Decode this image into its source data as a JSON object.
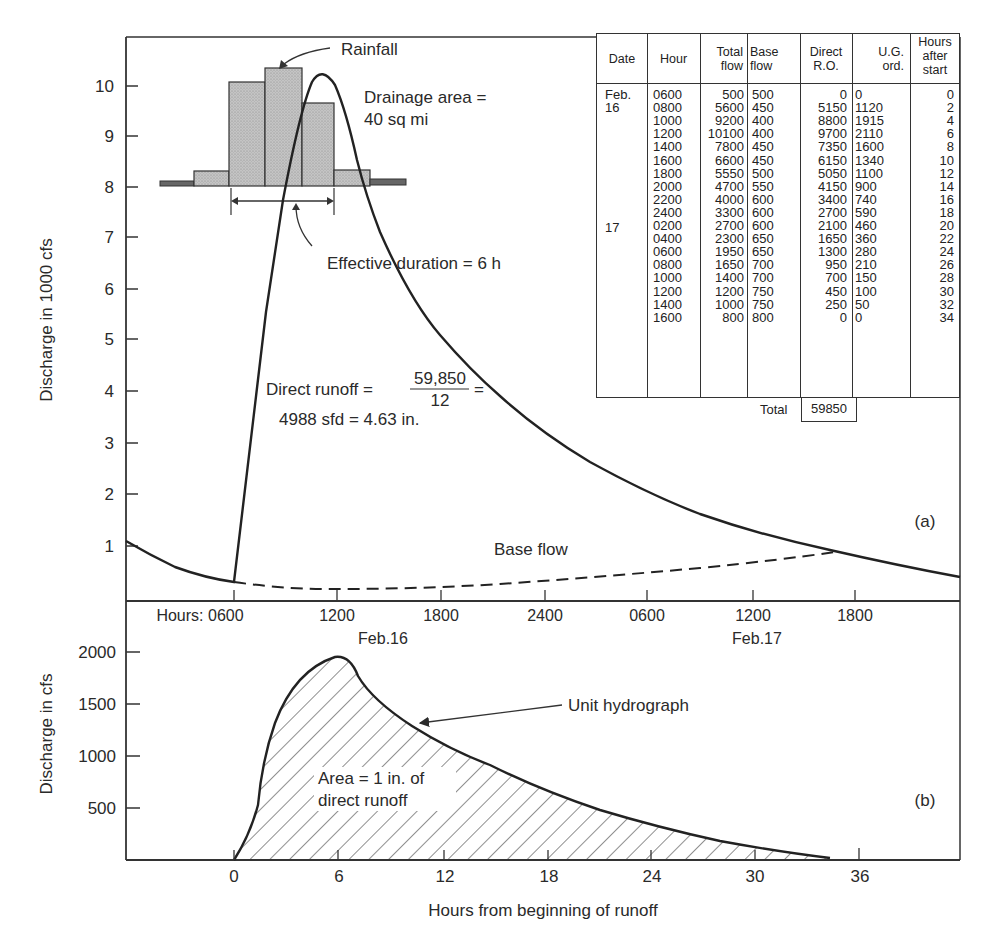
{
  "chart_data": [
    {
      "id": "a",
      "type": "line",
      "panel_label": "(a)",
      "title": "Streamflow hydrograph with base flow separation",
      "ylabel": "Discharge in 1000 cfs",
      "xlabel": "Hours",
      "ylim": [
        0,
        11
      ],
      "yticks": [
        1,
        2,
        3,
        4,
        5,
        6,
        7,
        8,
        9,
        10
      ],
      "x_prefix": "Hours:",
      "xtick_labels": [
        "0600",
        "1200",
        "1800",
        "2400",
        "0600",
        "1200",
        "1800"
      ],
      "date_labels": [
        {
          "text": "Feb.16",
          "under_tick": "1200"
        },
        {
          "text": "Feb.17",
          "under_tick": "1200"
        }
      ],
      "grid": false,
      "series": [
        {
          "name": "Total flow",
          "style": "solid",
          "unit": "cfs",
          "x_hours_from_0600_feb16": [
            0,
            2,
            4,
            6,
            8,
            10,
            12,
            14,
            16,
            18,
            20,
            22,
            24,
            26,
            28,
            30,
            32,
            34
          ],
          "values": [
            500,
            5600,
            9200,
            10100,
            7800,
            6600,
            5550,
            4700,
            4000,
            3300,
            2700,
            2300,
            1950,
            1650,
            1400,
            1200,
            1000,
            800
          ]
        },
        {
          "name": "Base flow",
          "style": "dashed",
          "unit": "cfs",
          "x_hours_from_0600_feb16": [
            0,
            2,
            4,
            6,
            8,
            10,
            12,
            14,
            16,
            18,
            20,
            22,
            24,
            26,
            28,
            30,
            32,
            34
          ],
          "values": [
            500,
            450,
            400,
            400,
            450,
            450,
            500,
            550,
            600,
            600,
            600,
            650,
            650,
            700,
            700,
            750,
            750,
            800
          ]
        }
      ],
      "rainfall_inset": {
        "label": "Rainfall",
        "bars_relative_heights": [
          0.05,
          0.35,
          1.0,
          1.08,
          0.85,
          0.28,
          0.05
        ],
        "effective_duration_label": "Effective duration = 6 h"
      },
      "annotations": [
        "Rainfall",
        "Drainage area =",
        "40 sq mi",
        "Effective duration = 6 h",
        "Direct runoff =",
        "59,850",
        "12",
        "4988 sfd = 4.63 in.",
        "Base flow",
        "(a)"
      ]
    },
    {
      "id": "b",
      "type": "area",
      "panel_label": "(b)",
      "title": "Unit hydrograph",
      "ylabel": "Discharge in cfs",
      "xlabel": "Hours from beginning of runoff",
      "ylim": [
        0,
        2200
      ],
      "yticks": [
        500,
        1000,
        1500,
        2000
      ],
      "xticks": [
        0,
        6,
        12,
        18,
        24,
        30,
        36
      ],
      "xlim": [
        -10,
        42
      ],
      "grid": false,
      "series": [
        {
          "name": "Unit hydrograph",
          "style": "solid-hatched",
          "x": [
            0,
            2,
            4,
            6,
            8,
            10,
            12,
            14,
            16,
            18,
            20,
            22,
            24,
            26,
            28,
            30,
            32,
            34
          ],
          "values": [
            0,
            1120,
            1915,
            2110,
            1600,
            1340,
            1100,
            900,
            740,
            590,
            460,
            360,
            280,
            210,
            150,
            100,
            50,
            0
          ]
        }
      ],
      "annotations": [
        "Unit hydrograph",
        "Area = 1 in. of",
        "direct runoff",
        "(b)"
      ]
    }
  ],
  "table": {
    "headers": [
      [
        "Date"
      ],
      [
        "Hour"
      ],
      [
        "Total",
        "flow"
      ],
      [
        "Base",
        "flow"
      ],
      [
        "Direct",
        "R.O."
      ],
      [
        "U.G.",
        "ord."
      ],
      [
        "Hours",
        "after",
        "start"
      ]
    ],
    "rows": [
      {
        "date": "Feb.",
        "hour": "0600",
        "total": "500",
        "base": "500",
        "direct": "0",
        "ug": "0",
        "hours": "0"
      },
      {
        "date": "16",
        "hour": "0800",
        "total": "5600",
        "base": "450",
        "direct": "5150",
        "ug": "1120",
        "hours": "2"
      },
      {
        "date": "",
        "hour": "1000",
        "total": "9200",
        "base": "400",
        "direct": "8800",
        "ug": "1915",
        "hours": "4"
      },
      {
        "date": "",
        "hour": "1200",
        "total": "10100",
        "base": "400",
        "direct": "9700",
        "ug": "2110",
        "hours": "6"
      },
      {
        "date": "",
        "hour": "1400",
        "total": "7800",
        "base": "450",
        "direct": "7350",
        "ug": "1600",
        "hours": "8"
      },
      {
        "date": "",
        "hour": "1600",
        "total": "6600",
        "base": "450",
        "direct": "6150",
        "ug": "1340",
        "hours": "10"
      },
      {
        "date": "",
        "hour": "1800",
        "total": "5550",
        "base": "500",
        "direct": "5050",
        "ug": "1100",
        "hours": "12"
      },
      {
        "date": "",
        "hour": "2000",
        "total": "4700",
        "base": "550",
        "direct": "4150",
        "ug": "900",
        "hours": "14"
      },
      {
        "date": "",
        "hour": "2200",
        "total": "4000",
        "base": "600",
        "direct": "3400",
        "ug": "740",
        "hours": "16"
      },
      {
        "date": "",
        "hour": "2400",
        "total": "3300",
        "base": "600",
        "direct": "2700",
        "ug": "590",
        "hours": "18"
      },
      {
        "date": "17",
        "hour": "0200",
        "total": "2700",
        "base": "600",
        "direct": "2100",
        "ug": "460",
        "hours": "20"
      },
      {
        "date": "",
        "hour": "0400",
        "total": "2300",
        "base": "650",
        "direct": "1650",
        "ug": "360",
        "hours": "22"
      },
      {
        "date": "",
        "hour": "0600",
        "total": "1950",
        "base": "650",
        "direct": "1300",
        "ug": "280",
        "hours": "24"
      },
      {
        "date": "",
        "hour": "0800",
        "total": "1650",
        "base": "700",
        "direct": "950",
        "ug": "210",
        "hours": "26"
      },
      {
        "date": "",
        "hour": "1000",
        "total": "1400",
        "base": "700",
        "direct": "700",
        "ug": "150",
        "hours": "28"
      },
      {
        "date": "",
        "hour": "1200",
        "total": "1200",
        "base": "750",
        "direct": "450",
        "ug": "100",
        "hours": "30"
      },
      {
        "date": "",
        "hour": "1400",
        "total": "1000",
        "base": "750",
        "direct": "250",
        "ug": "50",
        "hours": "32"
      },
      {
        "date": "",
        "hour": "1600",
        "total": "800",
        "base": "800",
        "direct": "0",
        "ug": "0",
        "hours": "34"
      }
    ],
    "total_label": "Total",
    "total_value": "59850"
  },
  "labels": {
    "top_ylabel": "Discharge in 1000 cfs",
    "bottom_ylabel": "Discharge in cfs",
    "bottom_xlabel": "Hours from beginning of runoff",
    "hours_prefix": "Hours: 0600",
    "tick_1200a": "1200",
    "tick_1800a": "1800",
    "tick_2400": "2400",
    "tick_0600b": "0600",
    "tick_1200b": "1200",
    "tick_1800b": "1800",
    "feb16": "Feb.16",
    "feb17": "Feb.17",
    "rainfall": "Rainfall",
    "drainage1": "Drainage area =",
    "drainage2": "40 sq mi",
    "effective": "Effective duration = 6 h",
    "direct_runoff": "Direct runoff =",
    "numerator": "59,850",
    "denominator": "12",
    "equals": "=",
    "direct_result": "4988 sfd = 4.63 in.",
    "base_flow": "Base flow",
    "panel_a": "(a)",
    "panel_b": "(b)",
    "unit_hydrograph": "Unit hydrograph",
    "area1": "Area = 1 in. of",
    "area2": "direct runoff"
  },
  "yticks_top": [
    "10",
    "9",
    "8",
    "7",
    "6",
    "5",
    "4",
    "3",
    "2",
    "1"
  ],
  "yticks_bottom": [
    "2000",
    "1500",
    "1000",
    "500"
  ],
  "xticks_bottom": [
    "0",
    "6",
    "12",
    "18",
    "24",
    "30",
    "36"
  ],
  "colors": {
    "ink": "#2a2a2a",
    "rain_fill": "#b8b8b8",
    "background": "#ffffff"
  }
}
